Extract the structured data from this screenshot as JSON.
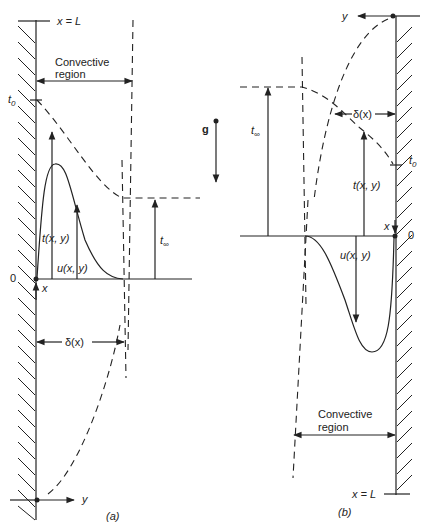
{
  "figure": {
    "panel_a": {
      "caption": "(a)",
      "top_label": "x = L",
      "region_label_line1": "Convective",
      "region_label_line2": "region",
      "t0_label": "t",
      "t0_sub": "0",
      "t_label": "t(x, y)",
      "u_label": "u(x, y)",
      "tinf_label": "t",
      "tinf_sub": "∞",
      "origin_label": "0",
      "x_axis_label": "x",
      "y_axis_label": "y",
      "delta_label": "δ(x)"
    },
    "gravity": {
      "label": "g"
    },
    "panel_b": {
      "caption": "(b)",
      "bottom_label": "x = L",
      "region_label_line1": "Convective",
      "region_label_line2": "region",
      "t0_label": "t",
      "t0_sub": "0",
      "t_label": "t(x, y)",
      "u_label": "u(x, y)",
      "tinf_label": "t",
      "tinf_sub": "∞",
      "origin_label": "0",
      "x_axis_label": "x",
      "y_axis_label": "y",
      "delta_label": "δ(x)"
    }
  }
}
